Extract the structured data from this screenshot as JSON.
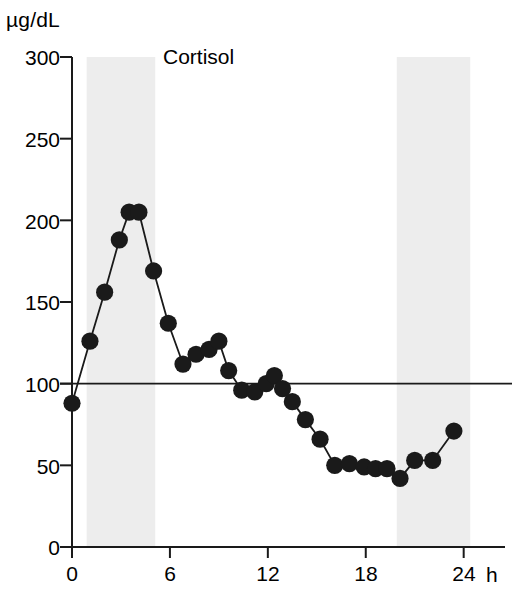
{
  "chart_data": {
    "type": "line",
    "title": "Cortisol",
    "xlabel": "h",
    "ylabel": "µg/dL",
    "xlim": [
      0,
      25
    ],
    "ylim": [
      0,
      300
    ],
    "grid": false,
    "legend": "none",
    "x_ticks": [
      "0",
      "6",
      "12",
      "18",
      "24"
    ],
    "x_tick_values": [
      0,
      6,
      12,
      18,
      24
    ],
    "y_ticks": [
      "0",
      "50",
      "100",
      "150",
      "200",
      "250",
      "300"
    ],
    "y_tick_values": [
      0,
      50,
      100,
      150,
      200,
      250,
      300
    ],
    "series": [
      {
        "name": "Cortisol",
        "marker": "filled-circle",
        "color": "#1a1a1a",
        "x": [
          0.0,
          1.1,
          2.0,
          2.9,
          3.5,
          4.1,
          5.0,
          5.9,
          6.8,
          7.6,
          8.4,
          9.0,
          9.6,
          10.4,
          11.2,
          11.9,
          12.4,
          12.9,
          13.5,
          14.3,
          15.2,
          16.1,
          17.0,
          17.9,
          18.6,
          19.3,
          20.1,
          21.0,
          22.1,
          23.4
        ],
        "y": [
          88,
          126,
          156,
          188,
          205,
          205,
          169,
          137,
          112,
          118,
          121,
          126,
          108,
          96,
          95,
          100,
          105,
          97,
          89,
          78,
          66,
          50,
          51,
          49,
          48,
          48,
          42,
          53,
          53,
          71
        ]
      }
    ],
    "reference_lines": [
      {
        "orientation": "horizontal",
        "value": 100,
        "color": "#1a1a1a"
      }
    ],
    "shaded_bands": [
      {
        "x_start": 0.9,
        "x_end": 5.1,
        "color": "#ededed"
      },
      {
        "x_start": 19.9,
        "x_end": 24.4,
        "color": "#ededed"
      }
    ]
  }
}
